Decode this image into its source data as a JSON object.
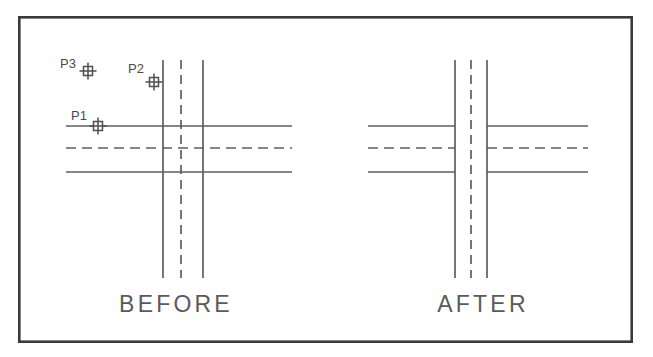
{
  "figure": {
    "background_color": "#ffffff",
    "border": {
      "name": "drawing-frame",
      "x": 18,
      "y": 16,
      "width": 615,
      "height": 327,
      "stroke": "#3a3a3a",
      "stroke_width": 2.6
    },
    "colors": {
      "line": "#5e5e5e",
      "line_dark": "#4e4e4e",
      "text": "#5a5a5a",
      "frame": "#3a3a3a"
    }
  },
  "panels": [
    {
      "id": "before",
      "caption": "BEFORE",
      "caption_x": 176,
      "caption_y": 312,
      "description": "All street lines cross straight through the intersection with no breaks; three point nodes P1, P2, P3 are shown.",
      "horizontal_lines": [
        {
          "name": "top-curb-line",
          "x1": 66,
          "x2": 292,
          "y": 126,
          "style": "solid"
        },
        {
          "name": "center-line",
          "x1": 66,
          "x2": 292,
          "y": 148,
          "style": "dashed"
        },
        {
          "name": "bottom-curb-line",
          "x1": 66,
          "x2": 292,
          "y": 172,
          "style": "solid"
        }
      ],
      "vertical_lines": [
        {
          "name": "left-curb-line",
          "y1": 60,
          "y2": 278,
          "x": 163,
          "style": "solid"
        },
        {
          "name": "center-line",
          "y1": 60,
          "y2": 278,
          "x": 181,
          "style": "dashed"
        },
        {
          "name": "right-curb-line",
          "y1": 60,
          "y2": 278,
          "x": 203,
          "style": "solid"
        }
      ],
      "points": [
        {
          "name": "point-p3",
          "label": "P3",
          "x": 88,
          "y": 71,
          "label_x": 60,
          "label_y": 68
        },
        {
          "name": "point-p2",
          "label": "P2",
          "x": 154,
          "y": 82,
          "label_x": 128,
          "label_y": 73
        },
        {
          "name": "point-p1",
          "label": "P1",
          "x": 98,
          "y": 126,
          "label_x": 71,
          "label_y": 120
        }
      ]
    },
    {
      "id": "after",
      "caption": "AFTER",
      "caption_x": 483,
      "caption_y": 312,
      "description": "Horizontal street lines are trimmed away inside the vertical street; only the vertical centerline continues through.",
      "horizontal_lines": [
        {
          "name": "top-curb-line-left",
          "x1": 368,
          "x2": 455,
          "y": 126,
          "style": "solid"
        },
        {
          "name": "top-curb-line-right",
          "x1": 487,
          "x2": 588,
          "y": 126,
          "style": "solid"
        },
        {
          "name": "center-line-left",
          "x1": 368,
          "x2": 455,
          "y": 148,
          "style": "dashed"
        },
        {
          "name": "center-line-right",
          "x1": 487,
          "x2": 588,
          "y": 148,
          "style": "dashed"
        },
        {
          "name": "bottom-curb-line-left",
          "x1": 368,
          "x2": 455,
          "y": 172,
          "style": "solid"
        },
        {
          "name": "bottom-curb-line-right",
          "x1": 487,
          "x2": 588,
          "y": 172,
          "style": "solid"
        }
      ],
      "vertical_lines": [
        {
          "name": "left-curb-line",
          "y1": 60,
          "y2": 278,
          "x": 455,
          "style": "solid"
        },
        {
          "name": "center-line",
          "y1": 60,
          "y2": 278,
          "x": 471,
          "style": "dashed"
        },
        {
          "name": "right-curb-line",
          "y1": 60,
          "y2": 278,
          "x": 487,
          "style": "solid"
        }
      ],
      "points": []
    }
  ],
  "marker": {
    "name": "point-node-marker",
    "shape": "square-with-cross",
    "square_size": 9,
    "cross_overhang": 4
  }
}
